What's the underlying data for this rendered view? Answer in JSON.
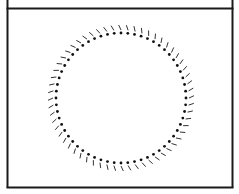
{
  "frame": {
    "left": 7.5,
    "right": 232.5,
    "top_divider_y": 8.5,
    "bottom": 187.5,
    "stroke": "#1a1a1a",
    "stroke_width": 2
  },
  "dial": {
    "center_x": 121,
    "center_y": 98,
    "dot_count": 60,
    "dot_radius_from_center": 65,
    "dot_size": 1.4,
    "dot_color": "#111111",
    "tick_count": 60,
    "tick_inner_radius": 68,
    "tick_outer_radius": 73,
    "tick_color": "#333333",
    "tick_width": 1,
    "tick_angle_skew_deg": 12
  }
}
